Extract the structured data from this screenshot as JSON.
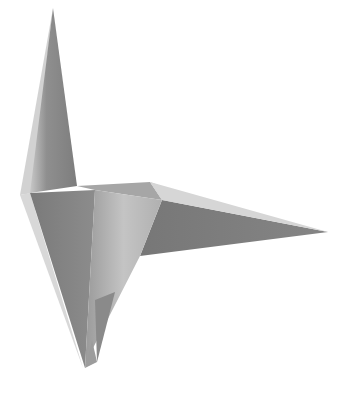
{
  "image": {
    "subject": "origami crane",
    "background": "#ffffff",
    "palette": {
      "dark": "#6f6f6f",
      "mid": "#8a8a8a",
      "light": "#b9b9b9",
      "highlight": "#dedede"
    }
  }
}
